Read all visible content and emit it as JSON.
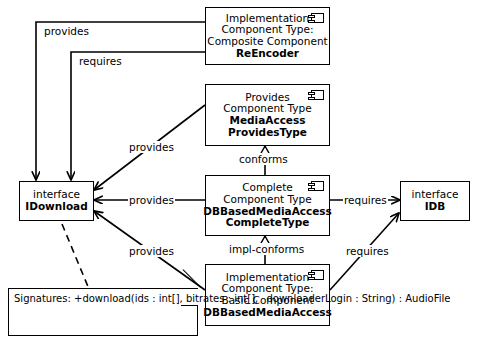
{
  "diagram": {
    "background": "#ffffff",
    "line_color": "#000000"
  },
  "nodes": {
    "reencoder": {
      "name": "implementation-composite-component-reencoder",
      "line1": "Implementation",
      "line2": "Component Type:",
      "line3": "Composite Component",
      "line4": "ReEncoder",
      "icon": "component-icon"
    },
    "media_access_provides": {
      "name": "provides-component-type-mediaaccess",
      "line1": "Provides",
      "line2": "Component Type",
      "line3": "MediaAccess",
      "line4": "ProvidesType",
      "icon": "component-icon"
    },
    "complete_type": {
      "name": "complete-component-type-dbbasedmediaaccess",
      "line1": "Complete",
      "line2": "Component Type",
      "line3": "DBBasedMediaAccess",
      "line4": "CompleteType",
      "icon": "component-icon"
    },
    "basic_impl": {
      "name": "implementation-basic-component-dbbasedmediaaccess",
      "line1": "Implementation",
      "line2": "Component Type:",
      "line3": "Basic Component",
      "line4": "DBBasedMediaAccess",
      "icon": "component-icon"
    },
    "idownload": {
      "name": "interface-idownload",
      "line1": "interface",
      "line2": "IDownload"
    },
    "idb": {
      "name": "interface-idb",
      "line1": "interface",
      "line2": "IDB"
    }
  },
  "note": {
    "name": "signatures-note",
    "line1": "Signatures:",
    "line2": "+download(ids : int[], bitrates : int[],",
    "line3": "downloaderLogin : String) : AudioFile"
  },
  "edges": [
    {
      "id": "reencoder-provides-idownload",
      "label": "provides",
      "from": "reencoder",
      "to": "idownload",
      "kind": "association-arrow"
    },
    {
      "id": "reencoder-requires-idownload",
      "label": "requires",
      "from": "reencoder",
      "to": "idownload",
      "kind": "association-arrow"
    },
    {
      "id": "mediaaccess-provides-idownload",
      "label": "provides",
      "from": "media_access_provides",
      "to": "idownload",
      "kind": "association-arrow"
    },
    {
      "id": "complete-provides-idownload",
      "label": "provides",
      "from": "complete_type",
      "to": "idownload",
      "kind": "association-arrow"
    },
    {
      "id": "basic-provides-idownload",
      "label": "provides",
      "from": "basic_impl",
      "to": "idownload",
      "kind": "association-arrow"
    },
    {
      "id": "complete-conforms-mediaaccess",
      "label": "conforms",
      "from": "complete_type",
      "to": "media_access_provides",
      "kind": "generalization"
    },
    {
      "id": "basic-implconforms-complete",
      "label": "impl-conforms",
      "from": "basic_impl",
      "to": "complete_type",
      "kind": "generalization"
    },
    {
      "id": "complete-requires-idb",
      "label": "requires",
      "from": "complete_type",
      "to": "idb",
      "kind": "association-arrow"
    },
    {
      "id": "basic-requires-idb",
      "label": "requires",
      "from": "basic_impl",
      "to": "idb",
      "kind": "association-arrow"
    },
    {
      "id": "idownload-note-link",
      "label": "",
      "from": "idownload",
      "to": "note",
      "kind": "dashed-anchor"
    }
  ]
}
